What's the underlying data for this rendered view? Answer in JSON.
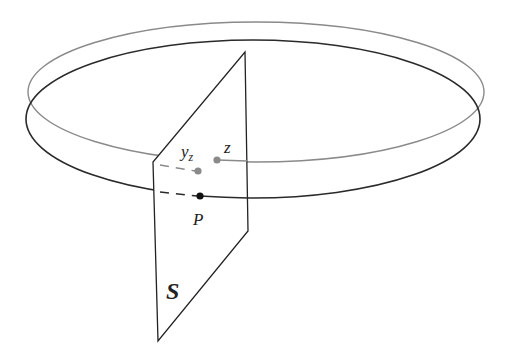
{
  "diagram": {
    "colors": {
      "background": "#ffffff",
      "gray_orbit": "#8a8a8a",
      "black_orbit": "#2a2a2a",
      "plane_edge": "#222222",
      "gray_point": "#8a8a8a",
      "black_point": "#111111"
    },
    "orbits": [
      {
        "name": "gray-orbit",
        "cx": 256,
        "cy": 92,
        "rx": 228,
        "ry": 70
      },
      {
        "name": "black-orbit",
        "cx": 253,
        "cy": 119,
        "rx": 227,
        "ry": 79
      }
    ],
    "plane": {
      "label": "S",
      "vertices": [
        [
          245,
          52
        ],
        [
          248,
          231
        ],
        [
          158,
          341
        ],
        [
          153,
          162
        ]
      ]
    },
    "points": [
      {
        "name": "z",
        "label": "z",
        "x": 217,
        "y": 160,
        "color": "gray"
      },
      {
        "name": "y_z",
        "label": "y",
        "sub": "z",
        "x": 198,
        "y": 171,
        "color": "gray"
      },
      {
        "name": "P",
        "label": "P",
        "x": 200,
        "y": 196,
        "color": "black"
      }
    ],
    "labels": {
      "z": "z",
      "y": "y",
      "y_sub": "z",
      "P": "P",
      "S": "S"
    }
  }
}
